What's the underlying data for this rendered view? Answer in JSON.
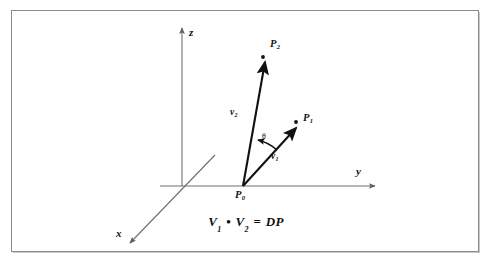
{
  "figure": {
    "title_equation": {
      "left_vector": "V",
      "left_sub": "1",
      "operator": "•",
      "right_vector": "V",
      "right_sub": "2",
      "equals": "=",
      "result": "DP",
      "full_text": "V1 • V2 = DP"
    },
    "axes": [
      {
        "name": "x-axis",
        "label": "x",
        "direction": "down-left-diagonal",
        "arrow": true
      },
      {
        "name": "y-axis",
        "label": "y",
        "direction": "right-horizontal",
        "arrow": true
      },
      {
        "name": "z-axis",
        "label": "z",
        "direction": "up-vertical",
        "arrow": true
      }
    ],
    "points": [
      {
        "name": "origin-point",
        "label": "P",
        "sub": "0",
        "role": "vector-origin"
      },
      {
        "name": "point-p1",
        "label": "P",
        "sub": "1",
        "role": "tip-of-v1"
      },
      {
        "name": "point-p2",
        "label": "P",
        "sub": "2",
        "role": "tip-of-v2"
      }
    ],
    "vectors": [
      {
        "name": "vector-v1",
        "label": "v",
        "sub": "1",
        "from": "P0",
        "to": "P1"
      },
      {
        "name": "vector-v2",
        "label": "v",
        "sub": "2",
        "from": "P0",
        "to": "P2"
      }
    ],
    "angle": {
      "name": "angle-theta",
      "label": "θ",
      "between": "v1 and v2"
    },
    "colors": {
      "line": "#111111",
      "axis": "#6e6e6e",
      "border": "#8a8a8a",
      "background": "#ffffff",
      "text": "#111111"
    }
  }
}
